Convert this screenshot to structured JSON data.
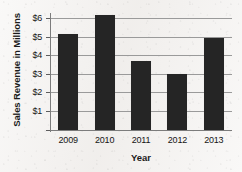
{
  "chart_data": {
    "type": "bar",
    "title": "",
    "subtitle": "",
    "xlabel": "Year",
    "ylabel": "Sales Revenue in Millions",
    "categories": [
      "2009",
      "2010",
      "2011",
      "2012",
      "2013"
    ],
    "values": [
      5.15,
      6.15,
      3.7,
      3.0,
      4.9
    ],
    "series": [
      {
        "name": "Sales Revenue",
        "values": [
          5.15,
          6.15,
          3.7,
          3.0,
          4.9
        ]
      }
    ],
    "ylim": [
      0,
      6.6
    ],
    "ytick_values": [
      1,
      2,
      3,
      4,
      5,
      6
    ],
    "ytick_labels": [
      "$1",
      "$2",
      "$3",
      "$4",
      "$5",
      "$6"
    ],
    "grid": "horizontal",
    "legend": "none",
    "bar_color": "#252525",
    "background_color": "#f2f0ee",
    "gridline_color": "#9a9a9a",
    "axis_color": "#7c7c7c"
  }
}
